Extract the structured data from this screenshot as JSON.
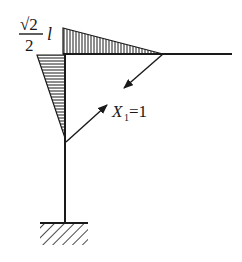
{
  "diagram": {
    "type": "bending-moment-diagram",
    "colors": {
      "stroke": "#1a1a1a",
      "background": "#ffffff"
    },
    "labels": {
      "moment_value": {
        "numerator": "√2",
        "denominator": "2",
        "suffix": "l"
      },
      "force": {
        "symbol": "X",
        "subscript": "1",
        "equals": "=1"
      }
    },
    "members": [
      {
        "name": "beam",
        "orientation": "horizontal"
      },
      {
        "name": "column",
        "orientation": "vertical"
      }
    ],
    "support": "fixed",
    "moment_regions": [
      {
        "member": "beam",
        "hatch": "vertical",
        "shape": "triangle"
      },
      {
        "member": "column",
        "hatch": "horizontal",
        "shape": "triangle"
      }
    ],
    "arrows": [
      {
        "name": "force-arrow-down-left",
        "direction": "down-left"
      },
      {
        "name": "force-arrow-up-right",
        "direction": "up-right"
      }
    ]
  }
}
